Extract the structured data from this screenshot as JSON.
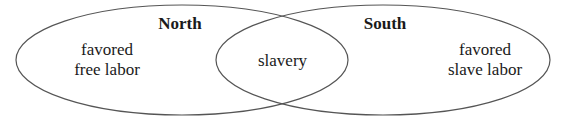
{
  "diagram": {
    "type": "venn",
    "sets": [
      {
        "name": "North",
        "unique": [
          "favored",
          "free labor"
        ]
      },
      {
        "name": "South",
        "unique": [
          "favored",
          "slave labor"
        ]
      }
    ],
    "intersection": "slavery"
  },
  "labels": {
    "north_title": "North",
    "south_title": "South",
    "north_line1": "favored",
    "north_line2": "free labor",
    "south_line1": "favored",
    "south_line2": "slave labor",
    "overlap": "slavery"
  },
  "colors": {
    "stroke": "#555555",
    "text": "#1a1a1a",
    "background": "#ffffff"
  }
}
